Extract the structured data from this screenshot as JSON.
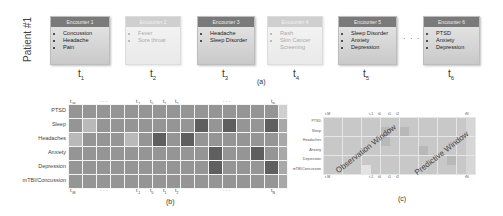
{
  "panel_a": {
    "patient_label": "Patient #1",
    "encounters": [
      {
        "title": "Encounter 1",
        "items": [
          "Concussion",
          "Headache",
          "Pain"
        ],
        "time": "t",
        "sub": "1",
        "faded": false
      },
      {
        "title": "Encounter 2",
        "items": [
          "Fever",
          "Sore throat"
        ],
        "time": "t",
        "sub": "2",
        "faded": true
      },
      {
        "title": "Encounter 3",
        "items": [
          "Headache",
          "Sleep Disorder"
        ],
        "time": "t",
        "sub": "3",
        "faded": false
      },
      {
        "title": "Encounter 4",
        "items": [
          "Rash",
          "Skin Cancer Screening"
        ],
        "time": "t",
        "sub": "4",
        "faded": true
      },
      {
        "title": "Encounter 5",
        "items": [
          "Sleep Disorder",
          "Anxiety",
          "Depression"
        ],
        "time": "t",
        "sub": "5",
        "faded": false
      },
      {
        "title": "Encounter 6",
        "items": [
          "PTSD",
          "Anxiety",
          "Depression"
        ],
        "time": "t",
        "sub": "6",
        "faded": false
      }
    ],
    "ellipsis": "· · ·",
    "caption": "(a)"
  },
  "panel_b": {
    "rows": [
      "PTSD",
      "Sleep",
      "Headaches",
      "Anxiety",
      "Depression",
      "mTBI/Concussion"
    ],
    "top_labels": [
      {
        "text": "t",
        "sub": "-M",
        "x": 70
      },
      {
        "text": "· · ·",
        "sub": "",
        "x": 100
      },
      {
        "text": "t",
        "sub": "-1",
        "x": 136
      },
      {
        "text": "t",
        "sub": "0",
        "x": 150
      },
      {
        "text": "t",
        "sub": "1",
        "x": 163
      },
      {
        "text": "t",
        "sub": "2",
        "x": 175
      },
      {
        "text": "· · ·",
        "sub": "",
        "x": 223
      },
      {
        "text": "t",
        "sub": "N",
        "x": 271
      }
    ],
    "caption": "(b)"
  },
  "panel_c": {
    "rows": [
      "PTSD",
      "Sleep",
      "Headaches",
      "Anxiety",
      "Depression",
      "mTBI/Concussion"
    ],
    "observation_label": "Observation Window",
    "predictive_label": "Predictive Window",
    "top_labels": [
      {
        "text": "t",
        "sub": "-M",
        "x": 325
      },
      {
        "text": "t",
        "sub": "-1",
        "x": 369
      },
      {
        "text": "t",
        "sub": "0",
        "x": 378
      },
      {
        "text": "t",
        "sub": "1",
        "x": 388
      },
      {
        "text": "t",
        "sub": "2",
        "x": 396
      },
      {
        "text": "t",
        "sub": "N",
        "x": 465
      }
    ],
    "caption": "(c)"
  },
  "chart_data": [
    {
      "type": "heatmap",
      "title": "(b) Patient symptom timeline matrix",
      "rows": [
        "PTSD",
        "Sleep",
        "Headaches",
        "Anxiety",
        "Depression",
        "mTBI/Concussion"
      ],
      "columns": [
        "t-M",
        "...",
        "...",
        "...",
        "...",
        "...",
        "t-1",
        "t0",
        "t1",
        "t2",
        "...",
        "...",
        "...",
        "...",
        "...",
        "tN"
      ],
      "values": [
        [
          2,
          2,
          2,
          2,
          2,
          2,
          2,
          2,
          2,
          2,
          2,
          2,
          2,
          2,
          2,
          1
        ],
        [
          2,
          1,
          2,
          2,
          2,
          2,
          2,
          2,
          2,
          4,
          2,
          4,
          2,
          2,
          4,
          2
        ],
        [
          1,
          2,
          2,
          2,
          1,
          2,
          4,
          2,
          4,
          2,
          2,
          2,
          2,
          2,
          2,
          2
        ],
        [
          2,
          2,
          2,
          2,
          2,
          2,
          2,
          2,
          2,
          2,
          4,
          2,
          2,
          4,
          2,
          2
        ],
        [
          2,
          2,
          2,
          2,
          2,
          2,
          2,
          2,
          2,
          2,
          4,
          2,
          2,
          2,
          4,
          2
        ],
        [
          2,
          2,
          2,
          2,
          2,
          2,
          2,
          2,
          2,
          2,
          2,
          2,
          2,
          2,
          2,
          2
        ]
      ],
      "scale": "0=white .. 4=dark gray",
      "xlabel": "",
      "ylabel": ""
    },
    {
      "type": "heatmap",
      "title": "(c) Observation vs predictive window",
      "rows": [
        "PTSD",
        "Sleep",
        "Headaches",
        "Anxiety",
        "Depression",
        "mTBI/Concussion"
      ],
      "annotations": [
        "Observation Window",
        "Predictive Window"
      ],
      "highlights": [
        {
          "row": "Sleep",
          "col": 6
        },
        {
          "row": "Sleep",
          "col": 8
        },
        {
          "row": "Headaches",
          "col": 6
        },
        {
          "row": "Anxiety",
          "col": 10
        },
        {
          "row": "Depression",
          "col": 13
        },
        {
          "row": "mTBI/Concussion",
          "col": 4,
          "light": true
        }
      ]
    }
  ]
}
